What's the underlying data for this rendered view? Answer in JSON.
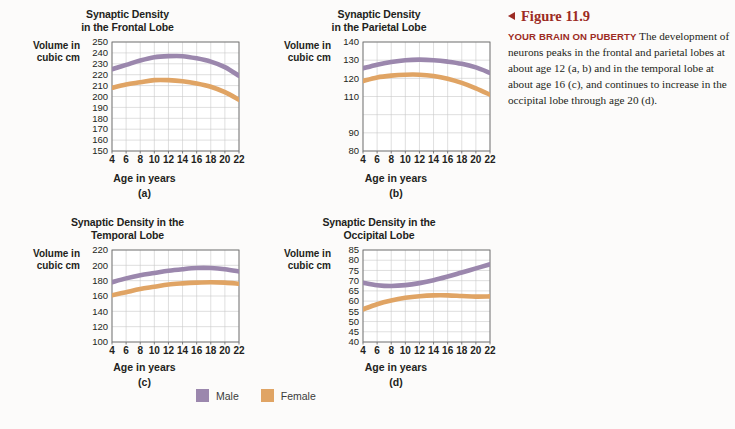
{
  "figure": {
    "number_label": "Figure 11.9",
    "marker_icon": "left-triangle-icon",
    "kicker": "YOUR BRAIN ON PUBERTY",
    "body": "The development of neurons peaks in the frontal and parietal lobes at about age 12 (a, b) and in the temporal lobe at about age 16 (c), and continues to increase in the occipital lobe through age 20 (d).",
    "accent_color": "#9c2b24"
  },
  "legend": {
    "position": "bottom-center",
    "items": [
      {
        "label": "Male",
        "color": "#9b87ad",
        "swatch_icon": "purple-square-icon"
      },
      {
        "label": "Female",
        "color": "#e0a464",
        "swatch_icon": "orange-square-icon"
      }
    ]
  },
  "common": {
    "xlabel": "Age in years",
    "ylabel": "Volume in cubic cm",
    "ylabel_line1": "Volume in",
    "ylabel_line2": "cubic cm",
    "xticks": [
      4,
      6,
      8,
      10,
      12,
      14,
      16,
      18,
      20,
      22
    ],
    "xlim": [
      4,
      22
    ]
  },
  "chart_data": [
    {
      "id": "a",
      "type": "line",
      "panel_label": "(a)",
      "title": "Synaptic Density in the Frontal Lobe",
      "title_line1": "Synaptic Density",
      "title_line2": "in the Frontal Lobe",
      "xlabel": "Age in years",
      "ylabel": "Volume in cubic cm",
      "xlim": [
        4,
        22
      ],
      "ylim": [
        150,
        250
      ],
      "yticks": [
        150,
        160,
        170,
        180,
        190,
        200,
        210,
        220,
        230,
        240,
        250
      ],
      "xticks": [
        4,
        6,
        8,
        10,
        12,
        14,
        16,
        18,
        20,
        22
      ],
      "grid": true,
      "x": [
        4,
        6,
        8,
        10,
        12,
        14,
        16,
        18,
        20,
        22
      ],
      "series": [
        {
          "name": "Male",
          "color": "#9b87ad",
          "values": [
            225,
            229,
            233,
            236,
            237,
            237,
            235,
            232,
            227,
            219
          ]
        },
        {
          "name": "Female",
          "color": "#e0a464",
          "values": [
            208,
            211,
            213,
            215,
            215,
            214,
            212,
            209,
            204,
            197
          ]
        }
      ]
    },
    {
      "id": "b",
      "type": "line",
      "panel_label": "(b)",
      "title": "Synaptic Density in the Parietal Lobe",
      "title_line1": "Synaptic Density",
      "title_line2": "in the Parietal Lobe",
      "xlabel": "Age in years",
      "ylabel": "Volume in cubic cm",
      "xlim": [
        4,
        22
      ],
      "ylim": [
        80,
        140
      ],
      "yticks": [
        80,
        90,
        110,
        120,
        130,
        140
      ],
      "ytick_values": [
        80,
        90,
        110,
        120,
        130,
        140
      ],
      "xticks": [
        4,
        6,
        8,
        10,
        12,
        14,
        16,
        18,
        20,
        22
      ],
      "grid": true,
      "x": [
        4,
        6,
        8,
        10,
        12,
        14,
        16,
        18,
        20,
        22
      ],
      "series": [
        {
          "name": "Male",
          "color": "#9b87ad",
          "values": [
            125.5,
            127.5,
            129,
            130,
            130.3,
            130,
            129.2,
            128,
            126,
            123
          ]
        },
        {
          "name": "Female",
          "color": "#e0a464",
          "values": [
            118.5,
            120.5,
            121.5,
            122,
            122,
            121.3,
            119.8,
            117.5,
            114.5,
            111
          ]
        }
      ]
    },
    {
      "id": "c",
      "type": "line",
      "panel_label": "(c)",
      "title": "Synaptic Density in the Temporal Lobe",
      "title_line1": "Synaptic Density in the",
      "title_line2": "Temporal Lobe",
      "xlabel": "Age in years",
      "ylabel": "Volume in cubic cm",
      "xlim": [
        4,
        22
      ],
      "ylim": [
        100,
        220
      ],
      "yticks": [
        100,
        120,
        140,
        160,
        180,
        200,
        220
      ],
      "xticks": [
        4,
        6,
        8,
        10,
        12,
        14,
        16,
        18,
        20,
        22
      ],
      "grid": true,
      "x": [
        4,
        6,
        8,
        10,
        12,
        14,
        16,
        18,
        20,
        22
      ],
      "series": [
        {
          "name": "Male",
          "color": "#9b87ad",
          "values": [
            178,
            183,
            187,
            190,
            193,
            195,
            196.5,
            196.5,
            195,
            192
          ]
        },
        {
          "name": "Female",
          "color": "#e0a464",
          "values": [
            161,
            165,
            169,
            172,
            175,
            176.5,
            177.5,
            178,
            177.5,
            176
          ]
        }
      ]
    },
    {
      "id": "d",
      "type": "line",
      "panel_label": "(d)",
      "title": "Synaptic Density in the Occipital Lobe",
      "title_line1": "Synaptic Density in the",
      "title_line2": "Occipital Lobe",
      "xlabel": "Age in years",
      "ylabel": "Volume in cubic cm",
      "xlim": [
        4,
        22
      ],
      "ylim": [
        40,
        85
      ],
      "yticks": [
        40,
        45,
        50,
        55,
        60,
        65,
        70,
        75,
        80,
        85
      ],
      "xticks": [
        4,
        6,
        8,
        10,
        12,
        14,
        16,
        18,
        20,
        22
      ],
      "grid": true,
      "x": [
        4,
        6,
        8,
        10,
        12,
        14,
        16,
        18,
        20,
        22
      ],
      "series": [
        {
          "name": "Male",
          "color": "#9b87ad",
          "values": [
            69,
            67.8,
            67.4,
            67.8,
            68.8,
            70.2,
            72,
            74,
            76,
            78
          ]
        },
        {
          "name": "Female",
          "color": "#e0a464",
          "values": [
            56,
            58.5,
            60.3,
            61.6,
            62.4,
            62.8,
            62.8,
            62.5,
            62.2,
            62.3
          ]
        }
      ]
    }
  ]
}
